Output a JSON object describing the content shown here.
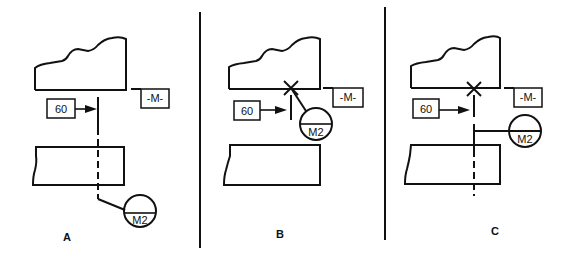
{
  "figure": {
    "panels": [
      {
        "id": "A",
        "label": "A",
        "feature_control": "60",
        "datum": "-M-",
        "symbol": "M2",
        "description": "Datum target leader from dashed line extension through part"
      },
      {
        "id": "B",
        "label": "B",
        "feature_control": "60",
        "datum": "-M-",
        "symbol": "M2",
        "description": "Datum target point marked with X on surface"
      },
      {
        "id": "C",
        "label": "C",
        "feature_control": "60",
        "datum": "-M-",
        "symbol": "M2",
        "description": "Datum target point X with dashed line extension and horizontal leader"
      }
    ],
    "colors": {
      "line": "#111111",
      "background": "#ffffff"
    }
  }
}
